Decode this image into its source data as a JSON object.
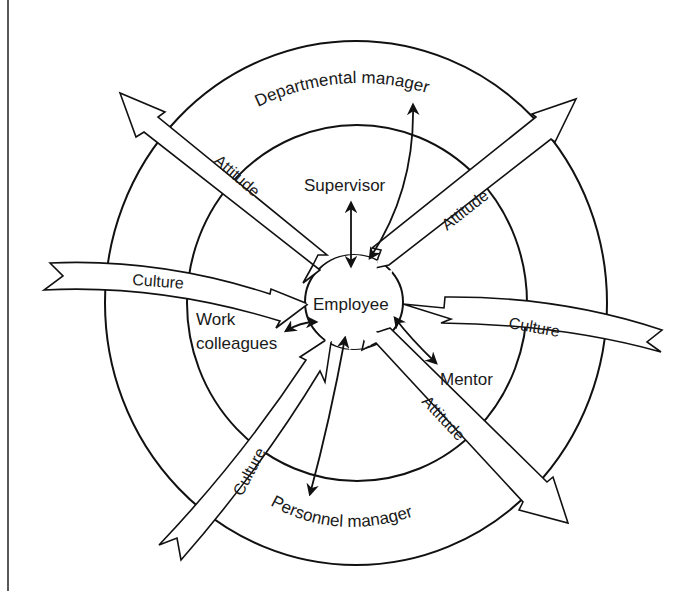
{
  "diagram": {
    "center_label": "Employee",
    "inner_ring_labels": {
      "supervisor": "Supervisor",
      "work_colleagues_line1": "Work",
      "work_colleagues_line2": "colleagues",
      "mentor": "Mentor"
    },
    "outer_ring_labels": {
      "top": "Departmental manager",
      "bottom": "Personnel manager"
    },
    "band_arrows": [
      {
        "id": "attitude-upper-left",
        "label": "Attitude",
        "direction": "outward"
      },
      {
        "id": "attitude-upper-right",
        "label": "Attitude",
        "direction": "outward"
      },
      {
        "id": "attitude-lower-right",
        "label": "Attitude",
        "direction": "outward"
      },
      {
        "id": "culture-left",
        "label": "Culture",
        "direction": "inward"
      },
      {
        "id": "culture-right",
        "label": "Culture",
        "direction": "inward"
      },
      {
        "id": "culture-lower-left",
        "label": "Culture",
        "direction": "inward"
      }
    ],
    "relationships": [
      {
        "from": "Employee",
        "to": "Supervisor",
        "type": "two-way"
      },
      {
        "from": "Employee",
        "to": "Departmental manager",
        "type": "two-way"
      },
      {
        "from": "Employee",
        "to": "Work colleagues",
        "type": "two-way"
      },
      {
        "from": "Employee",
        "to": "Mentor",
        "type": "two-way"
      },
      {
        "from": "Employee",
        "to": "Personnel manager",
        "type": "two-way"
      }
    ],
    "colors": {
      "stroke": "#111111",
      "background": "#ffffff"
    }
  }
}
